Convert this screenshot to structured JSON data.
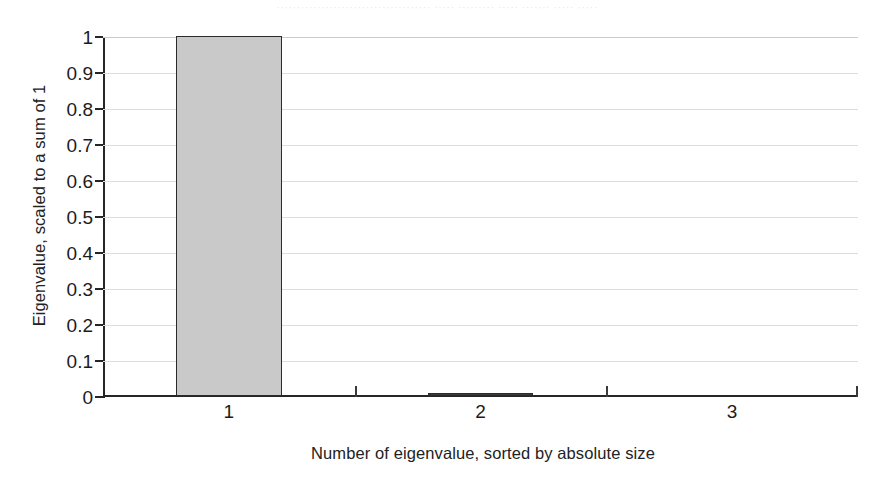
{
  "figure": {
    "top_artifact_text": "······································ ····· ········· ····· ······· ····· ·····"
  },
  "chart_data": {
    "type": "bar",
    "title": "",
    "subtitle": "",
    "xlabel": "Number of eigenvalue, sorted by absolute size",
    "ylabel": "Eigenvalue, scaled to a sum of 1",
    "categories": [
      "1",
      "2",
      "3"
    ],
    "values": [
      1,
      0.008,
      0
    ],
    "series": [
      {
        "name": "Eigenvalue, scaled to a sum of 1",
        "values": [
          1,
          0.008,
          0
        ]
      }
    ],
    "xlim": [
      0.5,
      3.5
    ],
    "ylim": [
      0,
      1
    ],
    "ytick_labels": [
      "0",
      "0.1",
      "0.2",
      "0.3",
      "0.4",
      "0.5",
      "0.6",
      "0.7",
      "0.8",
      "0.9",
      "1"
    ],
    "ytick_values": [
      0,
      0.1,
      0.2,
      0.3,
      0.4,
      0.5,
      0.6,
      0.7,
      0.8,
      0.9,
      1
    ],
    "xtick_labels": [
      "1",
      "2",
      "3"
    ],
    "xtick_values": [
      1,
      2,
      3
    ],
    "grid": "horizontal",
    "legend": null,
    "legend_position": "none",
    "bar_fill_color": "#c9c9c9",
    "bar_edge_color": "#2b2b2b",
    "gridline_color": "#dddde1",
    "axis_color": "#262626",
    "background_color": "#ffffff",
    "annotations": []
  }
}
